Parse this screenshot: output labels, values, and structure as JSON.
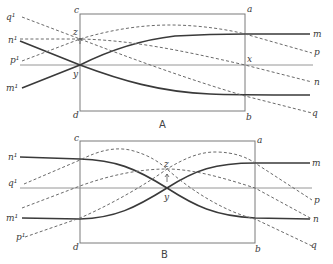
{
  "figure": {
    "panels": [
      {
        "caption": "A",
        "corners": {
          "top_left": "c",
          "top_right": "a",
          "bottom_left": "d",
          "bottom_right": "b"
        },
        "points": {
          "z": "z",
          "y": "y",
          "x": "x"
        },
        "left_labels": {
          "q": "q¹",
          "n": "n¹",
          "p": "p¹",
          "m": "m¹"
        },
        "right_labels": {
          "m": "m",
          "p": "p",
          "n": "n",
          "q": "q"
        }
      },
      {
        "caption": "B",
        "corners": {
          "top_left": "c",
          "top_right": "a",
          "bottom_left": "d",
          "bottom_right": "b"
        },
        "points": {
          "z": "z",
          "y": "y"
        },
        "left_labels": {
          "n": "n¹",
          "q": "q¹",
          "m": "m¹",
          "p": "p¹"
        },
        "right_labels": {
          "m": "m",
          "p": "p",
          "n": "n",
          "q": "q"
        }
      }
    ],
    "legend": {
      "solid_lines": [
        "m",
        "n"
      ],
      "dashed_lines": [
        "p",
        "q"
      ]
    }
  }
}
